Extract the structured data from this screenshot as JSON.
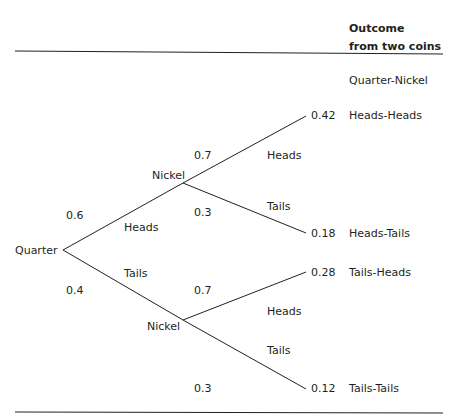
{
  "header": {
    "title_line1": "Outcome",
    "title_line2": "from two coins"
  },
  "column_label": "Quarter-Nickel",
  "root": {
    "label": "Quarter",
    "heads_prob": "0.6",
    "heads_label": "Heads",
    "tails_prob": "0.4",
    "tails_label": "Tails"
  },
  "upper_nickel": {
    "label": "Nickel",
    "heads_prob": "0.7",
    "heads_label": "Heads",
    "tails_prob": "0.3",
    "tails_label": "Tails"
  },
  "lower_nickel": {
    "label": "Nickel",
    "heads_prob": "0.7",
    "heads_label": "Heads",
    "tails_prob": "0.3",
    "tails_label": "Tails"
  },
  "outcomes": [
    {
      "prob": "0.42",
      "label": "Heads-Heads"
    },
    {
      "prob": "0.18",
      "label": "Heads-Tails"
    },
    {
      "prob": "0.28",
      "label": "Tails-Heads"
    },
    {
      "prob": "0.12",
      "label": "Tails-Tails"
    }
  ],
  "colors": {
    "line": "#231f20",
    "text": "#231f20"
  }
}
